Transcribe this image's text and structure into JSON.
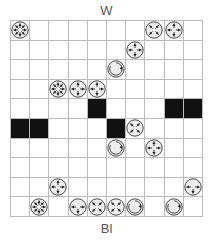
{
  "labels": {
    "top": "W",
    "bottom": "Bl"
  },
  "board": {
    "rows": 10,
    "cols": 10,
    "dark_cells": [
      [
        4,
        4
      ],
      [
        4,
        8
      ],
      [
        4,
        9
      ],
      [
        5,
        0
      ],
      [
        5,
        1
      ],
      [
        5,
        5
      ]
    ],
    "pieces": [
      {
        "row": 0,
        "col": 0,
        "type": "eight-way"
      },
      {
        "row": 0,
        "col": 7,
        "type": "diagonal"
      },
      {
        "row": 0,
        "col": 8,
        "type": "orthogonal"
      },
      {
        "row": 1,
        "col": 6,
        "type": "orthogonal"
      },
      {
        "row": 2,
        "col": 5,
        "type": "rotator"
      },
      {
        "row": 3,
        "col": 2,
        "type": "eight-way"
      },
      {
        "row": 3,
        "col": 3,
        "type": "orthogonal"
      },
      {
        "row": 3,
        "col": 4,
        "type": "orthogonal"
      },
      {
        "row": 5,
        "col": 6,
        "type": "diagonal"
      },
      {
        "row": 6,
        "col": 5,
        "type": "rotator"
      },
      {
        "row": 6,
        "col": 7,
        "type": "orthogonal"
      },
      {
        "row": 8,
        "col": 2,
        "type": "orthogonal"
      },
      {
        "row": 8,
        "col": 9,
        "type": "tee-down"
      },
      {
        "row": 9,
        "col": 1,
        "type": "eight-way"
      },
      {
        "row": 9,
        "col": 3,
        "type": "tee-down"
      },
      {
        "row": 9,
        "col": 4,
        "type": "diagonal"
      },
      {
        "row": 9,
        "col": 5,
        "type": "diagonal"
      },
      {
        "row": 9,
        "col": 6,
        "type": "rotator"
      },
      {
        "row": 9,
        "col": 8,
        "type": "rotator"
      }
    ]
  },
  "colors": {
    "dark_cell": "#111111",
    "grid_line": "#bbbbbb",
    "piece_outline": "#333333",
    "piece_fill": "#eeeeee"
  }
}
